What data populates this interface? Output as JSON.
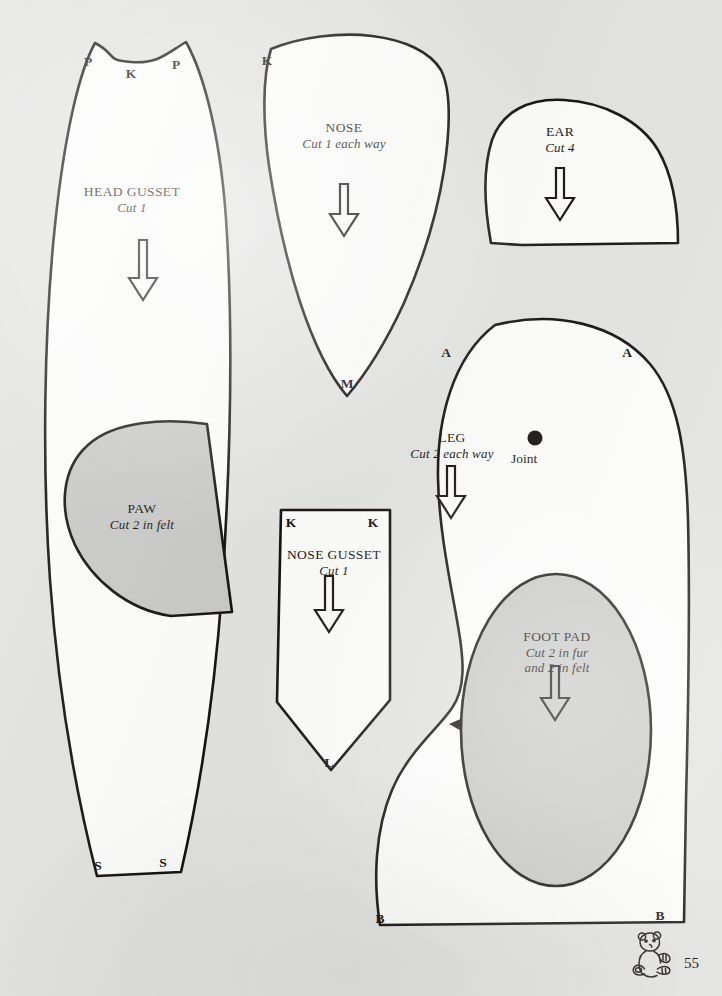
{
  "page": {
    "number": "55",
    "background_color": "#e3e3e2",
    "ink_color": "#15120f",
    "fur_fill_color": "#fdfdfc",
    "felt_fill_color": "#c9c9c8",
    "logo_icon": "teddy-bear-icon"
  },
  "pieces": [
    {
      "id": "head-gusset",
      "name": "HEAD GUSSET",
      "cut": "Cut 1",
      "fill": "fur",
      "grain_arrow": true,
      "notches": [
        {
          "letter": "P",
          "x": 88,
          "y": 58
        },
        {
          "letter": "K",
          "x": 131,
          "y": 71
        },
        {
          "letter": "P",
          "x": 176,
          "y": 62
        },
        {
          "letter": "S",
          "x": 98,
          "y": 866
        },
        {
          "letter": "S",
          "x": 163,
          "y": 862
        }
      ]
    },
    {
      "id": "nose",
      "name": "NOSE",
      "cut": "Cut 1 each way",
      "fill": "fur",
      "grain_arrow": true,
      "notches": [
        {
          "letter": "K",
          "x": 267,
          "y": 58
        },
        {
          "letter": "M",
          "x": 347,
          "y": 383
        }
      ]
    },
    {
      "id": "ear",
      "name": "EAR",
      "cut": "Cut 4",
      "fill": "fur",
      "grain_arrow": true,
      "notches": []
    },
    {
      "id": "paw",
      "name": "PAW",
      "cut": "Cut 2 in felt",
      "fill": "felt",
      "grain_arrow": false,
      "notches": []
    },
    {
      "id": "nose-gusset",
      "name": "NOSE GUSSET",
      "cut": "Cut 1",
      "fill": "fur",
      "grain_arrow": true,
      "notches": [
        {
          "letter": "K",
          "x": 291,
          "y": 521
        },
        {
          "letter": "K",
          "x": 373,
          "y": 521
        },
        {
          "letter": "L",
          "x": 329,
          "y": 762
        }
      ]
    },
    {
      "id": "leg",
      "name": "LEG",
      "cut": "Cut 2 each way",
      "fill": "fur",
      "grain_arrow": true,
      "joint_label": "Joint",
      "notches": [
        {
          "letter": "A",
          "x": 446,
          "y": 351
        },
        {
          "letter": "A",
          "x": 627,
          "y": 351
        },
        {
          "letter": "B",
          "x": 380,
          "y": 918
        },
        {
          "letter": "B",
          "x": 660,
          "y": 915
        }
      ]
    },
    {
      "id": "foot-pad",
      "name": "FOOT PAD",
      "cut": "Cut 2 in fur\nand 2 in felt",
      "cut_line_1": "Cut 2 in fur",
      "cut_line_2": "and 2 in felt",
      "fill": "felt",
      "grain_arrow": true,
      "notches": []
    }
  ]
}
